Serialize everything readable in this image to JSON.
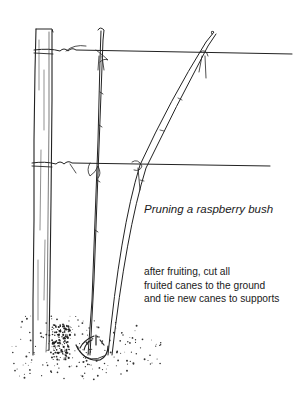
{
  "figure": {
    "title": "Pruning a raspberry bush",
    "note_lines": [
      "after fruiting, cut all",
      "fruited canes to the ground",
      "and tie new canes to supports"
    ],
    "ink_color": "#222222",
    "background_color": "#ffffff",
    "elements": [
      "wooden-post",
      "upper-wire",
      "lower-wire",
      "new-cane-straight",
      "new-cane-leaning",
      "cut-cane-stubs",
      "ground-stippling",
      "twine-ties"
    ]
  }
}
